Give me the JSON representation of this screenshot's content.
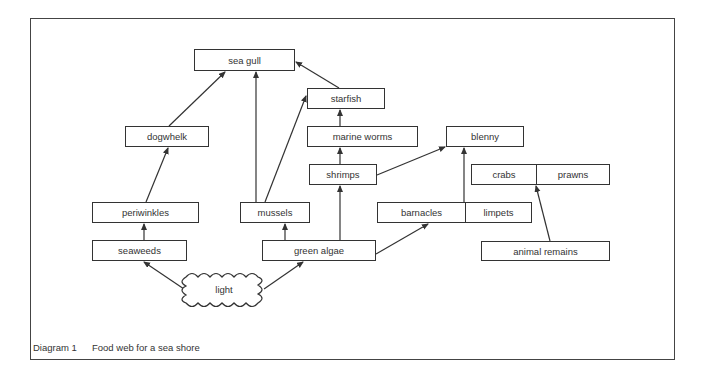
{
  "diagram": {
    "caption": {
      "number": "Diagram 1",
      "title": "Food web for a sea shore"
    },
    "nodes": {
      "sea_gull": "sea gull",
      "starfish": "starfish",
      "marine_worms": "marine worms",
      "blenny": "blenny",
      "shrimps": "shrimps",
      "crabs": "crabs",
      "prawns": "prawns",
      "dogwhelk": "dogwhelk",
      "periwinkles": "periwinkles",
      "mussels": "mussels",
      "barnacles": "barnacles",
      "limpets": "limpets",
      "seaweeds": "seaweeds",
      "green_algae": "green algae",
      "animal_remains": "animal remains",
      "light": "light"
    },
    "edges": [
      {
        "from": "light",
        "to": "seaweeds"
      },
      {
        "from": "light",
        "to": "green algae"
      },
      {
        "from": "seaweeds",
        "to": "periwinkles"
      },
      {
        "from": "periwinkles",
        "to": "dogwhelk"
      },
      {
        "from": "dogwhelk",
        "to": "sea gull"
      },
      {
        "from": "green algae",
        "to": "mussels"
      },
      {
        "from": "mussels",
        "to": "sea gull"
      },
      {
        "from": "mussels",
        "to": "starfish"
      },
      {
        "from": "green algae",
        "to": "shrimps"
      },
      {
        "from": "green algae",
        "to": "barnacles"
      },
      {
        "from": "shrimps",
        "to": "marine worms"
      },
      {
        "from": "marine worms",
        "to": "starfish"
      },
      {
        "from": "starfish",
        "to": "sea gull"
      },
      {
        "from": "shrimps",
        "to": "blenny"
      },
      {
        "from": "barnacles / limpets",
        "to": "blenny"
      },
      {
        "from": "animal remains",
        "to": "crabs / prawns"
      }
    ]
  }
}
